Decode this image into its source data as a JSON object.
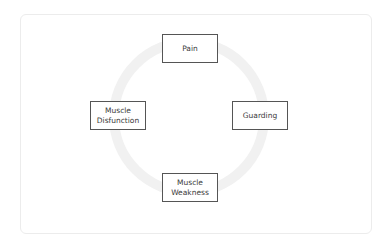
{
  "diagram": {
    "type": "cycle",
    "ring_color": "#f1f1f1",
    "box_border_color": "#555555",
    "nodes": [
      {
        "id": "pain",
        "lines": [
          "Pain"
        ],
        "position": "top"
      },
      {
        "id": "guarding",
        "lines": [
          "Guarding"
        ],
        "position": "right"
      },
      {
        "id": "muscle-weakness",
        "lines": [
          "Muscle",
          "Weakness"
        ],
        "position": "bottom"
      },
      {
        "id": "muscle-disfunction",
        "lines": [
          "Muscle",
          "Disfunction"
        ],
        "position": "left"
      }
    ]
  }
}
